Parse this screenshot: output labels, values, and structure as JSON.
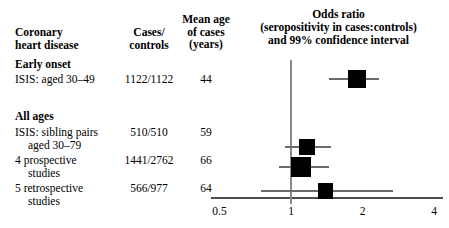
{
  "table": {
    "headers": {
      "disease": "Coronary\nheart disease",
      "disease_l1": "Coronary",
      "disease_l2": "heart disease",
      "cases_l1": "Cases/",
      "cases_l2": "controls",
      "age_l1": "Mean age",
      "age_l2": "of cases",
      "age_l3": "(years)"
    },
    "groups": [
      {
        "label": "Early onset"
      },
      {
        "label": "All ages"
      }
    ],
    "rows": [
      {
        "label_line1": "ISIS: aged 30–49",
        "label_line2": "",
        "cases_controls": "1122/1122",
        "mean_age": "44"
      },
      {
        "label_line1": "ISIS: sibling pairs",
        "label_line2": "aged 30–79",
        "cases_controls": "510/510",
        "mean_age": "59"
      },
      {
        "label_line1": "4 prospective",
        "label_line2": "studies",
        "cases_controls": "1441/2762",
        "mean_age": "66"
      },
      {
        "label_line1": "5 retrospective",
        "label_line2": "studies",
        "cases_controls": "566/977",
        "mean_age": "64"
      }
    ]
  },
  "chart_data": {
    "type": "forest",
    "title_line1": "Odds ratio",
    "title_line2": "(seropositivity in cases:controls)",
    "title_line3": "and 99% confidence interval",
    "xlabel": "",
    "ylabel": "",
    "scale": "log",
    "xlim": [
      0.5,
      4
    ],
    "ticks": [
      0.5,
      1,
      2,
      4
    ],
    "tick_labels": [
      "0.5",
      "1",
      "2",
      "4"
    ],
    "null_value": 1,
    "grid": false,
    "legend": "none",
    "series": [
      {
        "name": "ISIS: aged 30–49",
        "odds_ratio": 1.9,
        "ci_low": 1.45,
        "ci_high": 2.35,
        "weight": 0.72
      },
      {
        "name": "ISIS: sibling pairs aged 30–79",
        "odds_ratio": 1.17,
        "ci_low": 0.94,
        "ci_high": 1.47,
        "weight": 0.6
      },
      {
        "name": "4 prospective studies",
        "odds_ratio": 1.1,
        "ci_low": 0.89,
        "ci_high": 1.45,
        "weight": 1.0
      },
      {
        "name": "5 retrospective studies",
        "odds_ratio": 1.4,
        "ci_low": 0.75,
        "ci_high": 2.7,
        "weight": 0.5
      }
    ]
  }
}
